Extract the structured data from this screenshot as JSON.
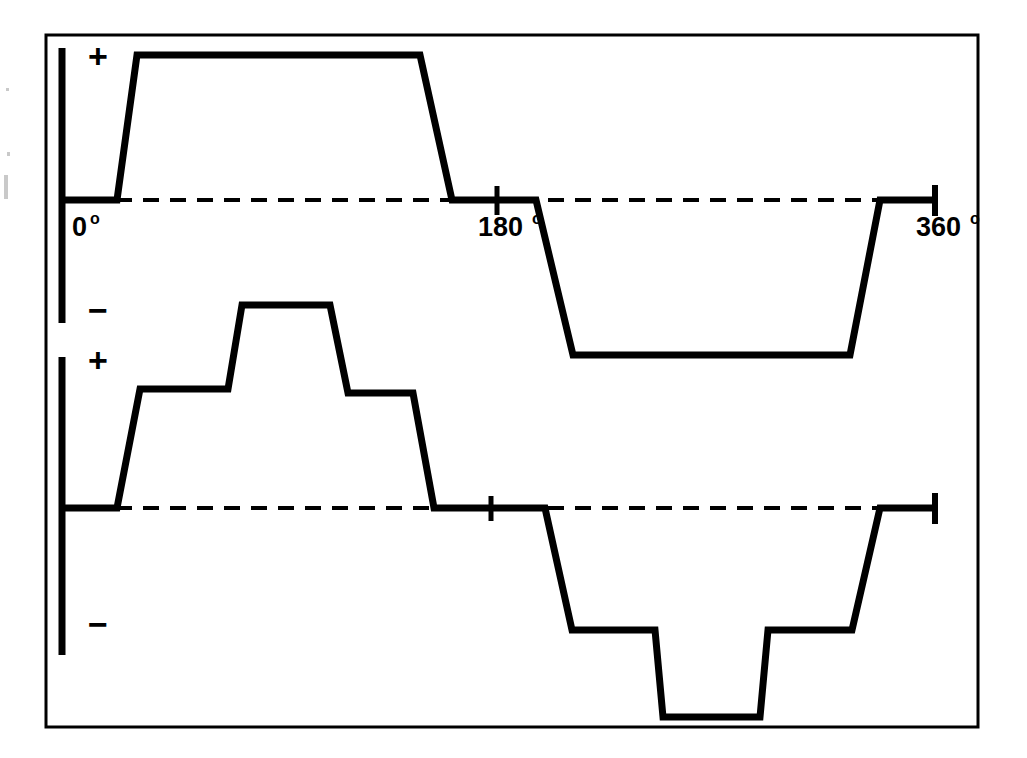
{
  "figure": {
    "background_color": "#ffffff",
    "line_color": "#000000",
    "frame": {
      "x": 46,
      "y": 35,
      "width": 932,
      "height": 692,
      "stroke_width": 3
    }
  },
  "axis_labels": {
    "plus": "+",
    "minus": "−",
    "degree_symbol": "o",
    "deg_0": "0",
    "deg_180": "180",
    "deg_360": "360"
  },
  "traces": [
    {
      "name": "upper-trace",
      "label": "trapezoidal-square-wave",
      "baseline_y": 200,
      "positive_marker": "+",
      "negative_marker": "−",
      "vertical_axis": {
        "x": 62,
        "y_top": 48,
        "y_bottom": 323,
        "stroke_width": 7
      },
      "baseline_dashes": {
        "x_start": 62,
        "x_end": 935,
        "dash": "16 11",
        "stroke_width": 4
      },
      "ticks": [
        {
          "label": "0",
          "x": 62,
          "kind": "origin"
        },
        {
          "label": "180",
          "x": 497,
          "kind": "cross"
        },
        {
          "label": "360",
          "x": 935,
          "kind": "end-bar"
        }
      ],
      "points": [
        [
          62,
          200
        ],
        [
          117,
          200
        ],
        [
          137,
          55
        ],
        [
          420,
          55
        ],
        [
          452,
          200
        ],
        [
          536,
          200
        ],
        [
          573,
          355
        ],
        [
          850,
          355
        ],
        [
          880,
          200
        ],
        [
          935,
          200
        ]
      ]
    },
    {
      "name": "lower-trace",
      "label": "stepped-staircase-wave",
      "baseline_y": 508,
      "positive_marker": "+",
      "negative_marker": "−",
      "vertical_axis": {
        "x": 62,
        "y_top": 357,
        "y_bottom": 655,
        "stroke_width": 7
      },
      "baseline_dashes": {
        "x_start": 62,
        "x_end": 935,
        "dash": "16 11",
        "stroke_width": 4
      },
      "ticks": [
        {
          "label": "0",
          "x": 62,
          "kind": "origin"
        },
        {
          "label": "180",
          "x": 491,
          "kind": "cross"
        },
        {
          "label": "360",
          "x": 935,
          "kind": "end-bar"
        }
      ],
      "points": [
        [
          62,
          508
        ],
        [
          117,
          508
        ],
        [
          140,
          389
        ],
        [
          228,
          389
        ],
        [
          242,
          305
        ],
        [
          330,
          305
        ],
        [
          348,
          393
        ],
        [
          413,
          393
        ],
        [
          434,
          508
        ],
        [
          545,
          508
        ],
        [
          572,
          630
        ],
        [
          655,
          630
        ],
        [
          663,
          717
        ],
        [
          760,
          717
        ],
        [
          768,
          630
        ],
        [
          852,
          630
        ],
        [
          880,
          508
        ],
        [
          935,
          508
        ]
      ]
    }
  ],
  "annotations": {
    "upper_plus": {
      "text": "+",
      "x": 88,
      "y": 68
    },
    "upper_minus": {
      "text": "−",
      "x": 88,
      "y": 322
    },
    "lower_plus": {
      "text": "+",
      "x": 88,
      "y": 372
    },
    "lower_minus": {
      "text": "−",
      "x": 88,
      "y": 636
    },
    "deg0": {
      "num": "0",
      "sup": "o",
      "x": 72,
      "y": 236
    },
    "deg180": {
      "num": "180",
      "sup": "o",
      "x": 478,
      "y": 236
    },
    "deg360": {
      "num": "360",
      "sup": "o",
      "x": 916,
      "y": 236
    }
  },
  "chart_data": {
    "type": "line",
    "xlabel": "",
    "ylabel": "",
    "xlim": [
      0,
      360
    ],
    "grid": false,
    "legend": "none",
    "xticks": [
      0,
      180,
      360
    ],
    "xticklabels": [
      "0°",
      "180°",
      "360°"
    ],
    "yticklabels": [
      "+",
      "−"
    ],
    "series": [
      {
        "name": "upper-trace",
        "description": "Trapezoidal square wave: flat zero, ramp up to full positive plateau, ramp back through zero, down to full negative plateau, ramp back to zero.",
        "x": [
          0,
          23,
          31,
          148,
          161,
          196,
          211,
          325,
          337,
          360
        ],
        "y": [
          0,
          0,
          1.0,
          1.0,
          0,
          0,
          -1.07,
          -1.07,
          0,
          0
        ]
      },
      {
        "name": "lower-trace",
        "description": "Six-step staircase wave: two rising steps to a peak, two falling steps back to zero, then mirrored negative staircase with a deeper central trough.",
        "x": [
          0,
          23,
          32,
          68,
          74,
          111,
          118,
          145,
          154,
          199,
          210,
          245,
          248,
          288,
          291,
          326,
          337,
          360
        ],
        "y": [
          0,
          0,
          0.82,
          0.82,
          1.4,
          1.4,
          0.79,
          0.79,
          0,
          0,
          -0.84,
          -0.84,
          -1.44,
          -1.44,
          -0.84,
          -0.84,
          0,
          0
        ]
      }
    ]
  }
}
